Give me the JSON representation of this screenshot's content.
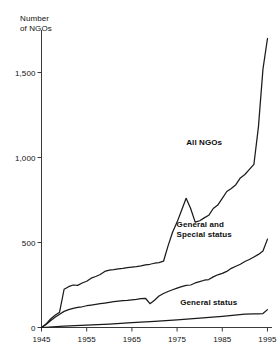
{
  "chart_data": {
    "type": "line",
    "title": "",
    "subtitle": "",
    "xlabel": "",
    "ylabel": "Number\nof NGOs",
    "xlim": [
      1945,
      1996
    ],
    "ylim": [
      0,
      1750
    ],
    "grid": false,
    "legend_position": "inline-annotations",
    "y_ticks": [
      0,
      500,
      1000,
      1500
    ],
    "y_tick_labels": [
      "0",
      "500",
      "1,000",
      "1,500"
    ],
    "x_ticks": [
      1945,
      1955,
      1965,
      1975,
      1985,
      1995
    ],
    "x_tick_labels": [
      "1945",
      "1955",
      "1965",
      "1975",
      "1985",
      "1995"
    ],
    "annotations": [
      {
        "text": "All NGOs",
        "x": 1981,
        "y": 1080
      },
      {
        "text": "General and\nSpecial status",
        "x": 1981,
        "y": 600
      },
      {
        "text": "General status",
        "x": 1982,
        "y": 140
      }
    ],
    "series": [
      {
        "name": "All NGOs",
        "color": "#1a1a1a",
        "x": [
          1945,
          1946,
          1947,
          1948,
          1949,
          1950,
          1951,
          1952,
          1953,
          1954,
          1955,
          1956,
          1957,
          1958,
          1959,
          1960,
          1961,
          1962,
          1963,
          1964,
          1965,
          1966,
          1967,
          1968,
          1969,
          1970,
          1971,
          1972,
          1973,
          1974,
          1975,
          1976,
          1977,
          1978,
          1979,
          1980,
          1981,
          1982,
          1983,
          1984,
          1985,
          1986,
          1987,
          1988,
          1989,
          1990,
          1991,
          1992,
          1993,
          1994,
          1995
        ],
        "values": [
          0,
          20,
          50,
          72,
          90,
          225,
          240,
          250,
          248,
          262,
          272,
          290,
          300,
          312,
          330,
          338,
          340,
          345,
          348,
          352,
          355,
          358,
          362,
          368,
          372,
          378,
          382,
          390,
          480,
          560,
          620,
          690,
          760,
          700,
          620,
          628,
          645,
          660,
          700,
          720,
          760,
          800,
          818,
          840,
          880,
          900,
          930,
          960,
          1180,
          1520,
          1700
        ]
      },
      {
        "name": "General and Special status",
        "color": "#1a1a1a",
        "x": [
          1945,
          1946,
          1947,
          1948,
          1949,
          1950,
          1951,
          1952,
          1953,
          1954,
          1955,
          1956,
          1957,
          1958,
          1959,
          1960,
          1961,
          1962,
          1963,
          1964,
          1965,
          1966,
          1967,
          1968,
          1969,
          1970,
          1971,
          1972,
          1973,
          1974,
          1975,
          1976,
          1977,
          1978,
          1979,
          1980,
          1981,
          1982,
          1983,
          1984,
          1985,
          1986,
          1987,
          1988,
          1989,
          1990,
          1991,
          1992,
          1993,
          1994,
          1995
        ],
        "values": [
          0,
          18,
          40,
          60,
          78,
          95,
          105,
          112,
          118,
          122,
          128,
          132,
          136,
          140,
          144,
          148,
          152,
          155,
          158,
          160,
          163,
          166,
          170,
          172,
          140,
          160,
          185,
          200,
          212,
          222,
          232,
          240,
          248,
          250,
          262,
          270,
          278,
          282,
          298,
          310,
          318,
          330,
          348,
          360,
          372,
          388,
          400,
          415,
          430,
          450,
          520
        ]
      },
      {
        "name": "General status",
        "color": "#1a1a1a",
        "x": [
          1945,
          1950,
          1955,
          1960,
          1965,
          1970,
          1975,
          1980,
          1985,
          1990,
          1992,
          1993,
          1994,
          1995
        ],
        "values": [
          0,
          8,
          14,
          20,
          28,
          36,
          45,
          55,
          66,
          78,
          80,
          80,
          82,
          105
        ]
      }
    ]
  },
  "axes": {
    "y_title": "Number\nof NGOs"
  }
}
